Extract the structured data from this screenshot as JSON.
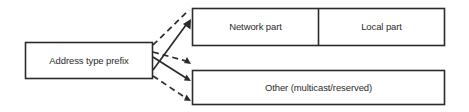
{
  "diagram": {
    "background_color": "#ffffff",
    "line_color": "#2b2b2b",
    "text_color": "#2b2b2b",
    "nodes": {
      "prefix": {
        "label": "Address type prefix"
      },
      "network": {
        "label": "Network part"
      },
      "local": {
        "label": "Local part"
      },
      "other": {
        "label": "Other (multicast/reserved)"
      }
    },
    "connectors": [
      {
        "name": "prefix-to-network-dashed-upper",
        "style": "dashed",
        "arrowhead": false
      },
      {
        "name": "prefix-to-network-solid",
        "style": "solid",
        "arrowhead": true
      },
      {
        "name": "prefix-to-other-dashed-middle",
        "style": "dashed",
        "arrowhead": true
      },
      {
        "name": "prefix-to-other-solid",
        "style": "solid",
        "arrowhead": true
      },
      {
        "name": "prefix-to-other-dashed-lower",
        "style": "dashed",
        "arrowhead": true
      }
    ]
  }
}
